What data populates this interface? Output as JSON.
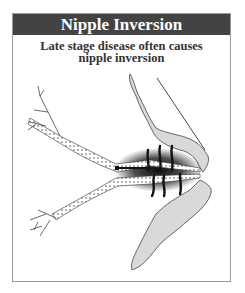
{
  "figure": {
    "title": "Nipple Inversion",
    "caption_line1": "Late stage disease often causes",
    "caption_line2": "nipple inversion",
    "colors": {
      "header_bg": "#434343",
      "header_text": "#ffffff",
      "tissue_fill": "#d9d9d9",
      "tumor": "#111111",
      "frame_border": "#9a9a9a"
    },
    "illustration": "breast-duct-cross-section-with-tumor-and-inverted-nipple"
  }
}
